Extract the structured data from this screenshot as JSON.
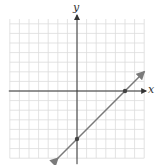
{
  "chart_data": {
    "type": "line",
    "title": "",
    "xlabel": "x",
    "ylabel": "y",
    "grid": true,
    "xlim": [
      -7,
      7
    ],
    "ylim": [
      -7,
      7.5
    ],
    "series": [
      {
        "name": "line",
        "equation": "y = x - 5",
        "slope": 1,
        "intercept": -5,
        "points": [
          [
            0,
            -5
          ],
          [
            5,
            0
          ]
        ],
        "x": [
          -2,
          7
        ],
        "y": [
          -7,
          2
        ]
      }
    ],
    "marked_points": [
      {
        "label": "y-intercept",
        "x": 0,
        "y": -5
      },
      {
        "label": "x-intercept",
        "x": 5,
        "y": 0
      }
    ],
    "colors": {
      "grid": "#dcdcdc",
      "axis": "#333333",
      "line": "#7a7a7a",
      "point": "#444444"
    }
  },
  "labels": {
    "x": "x",
    "y": "y"
  }
}
